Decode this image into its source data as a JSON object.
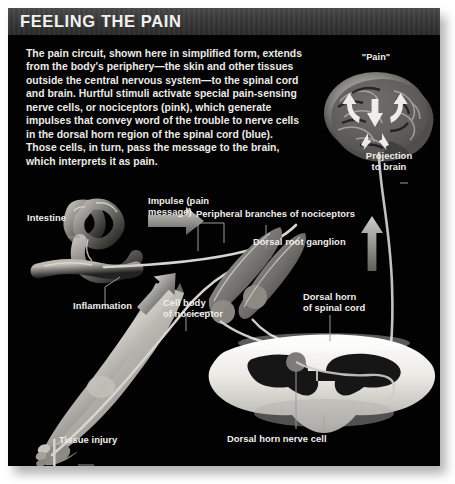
{
  "figure": {
    "title": "FEELING THE PAIN",
    "body": "The pain circuit, shown here in simplified form, extends from the body's periphery—the skin and other tissues outside the central nervous system—to the spinal cord and brain. Hurtful stimuli activate special pain-sensing nerve cells, or nociceptors (pink), which generate impulses that convey  word of the trouble to nerve cells in the dorsal horn region of the spinal cord (blue). Those cells, in turn, pass the message to the brain, which interprets it as pain."
  },
  "labels": {
    "pain": "\"Pain\"",
    "projection_to_brain": "Projection\nto brain",
    "intestine": "Intestine",
    "impulse": "Impulse (pain\nmessage)",
    "inflammation": "Inflammation",
    "peripheral_branches": "Peripheral branches of nociceptors",
    "dorsal_root_ganglion": "Dorsal root ganglion",
    "cell_body": "Cell body\nof nociceptor",
    "dorsal_horn_spinal_cord": "Dorsal horn\nof spinal cord",
    "dorsal_horn_nerve_cell": "Dorsal horn nerve cell",
    "tissue_injury": "Tissue injury"
  },
  "colors": {
    "background": "#000000",
    "header_bar": "#393939",
    "text": "#f0eeea",
    "leader_line": "#9a9a9a",
    "spinal_white_matter": "#e8e6e1",
    "spinal_gray_matter": "#151515",
    "nerve": "#cfcdc8"
  },
  "icons": {
    "impulse_arrow": "arrow-right-icon",
    "inflammation_arrow": "arrow-up-right-icon",
    "projection_arrow": "arrow-up-icon",
    "pain_arrows": "radiating-arrows-icon"
  }
}
